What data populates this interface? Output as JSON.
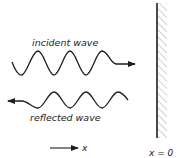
{
  "diagram": {
    "incident_label": "incident wave",
    "reflected_label": "reflected wave",
    "axis_label": "x",
    "wall_label": "x = 0",
    "colors": {
      "stroke": "#1e1e1e",
      "hatch": "#8a8a8a",
      "text": "#222222",
      "background": "#ffffff"
    }
  }
}
